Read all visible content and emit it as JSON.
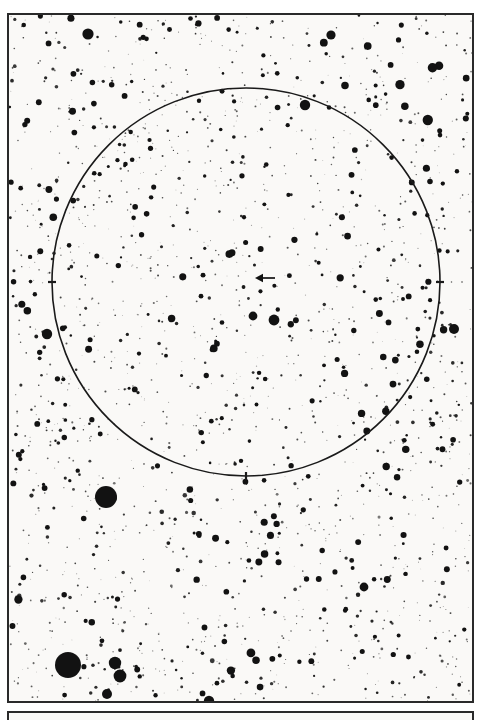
{
  "figure": {
    "kind": "astronomical-finder-chart",
    "title": "Star field finder chart",
    "background_color": "#faf9f7",
    "ink_color": "#121212",
    "frame_color": "#2a2a2a"
  },
  "plate": {
    "frame": {
      "x": 7,
      "y": 13,
      "width": 467,
      "height": 690,
      "border_width": 2
    },
    "secondary_frame": {
      "x": 7,
      "y": 711,
      "width": 467,
      "height": 9,
      "border_width": 2
    }
  },
  "chart_data": {
    "type": "scatter",
    "title": "Star field finder chart",
    "subtitle": "",
    "xlabel": "",
    "ylabel": "",
    "xlim": [
      0,
      467
    ],
    "ylim": [
      0,
      690
    ],
    "grid": false,
    "legend_position": "none",
    "annotations": [
      {
        "name": "target-arrow",
        "type": "arrow",
        "label": "",
        "tip_x": 246,
        "tip_y": 263,
        "tail_x": 266,
        "tail_y": 263,
        "direction": "left",
        "color": "#121212"
      }
    ],
    "overlays": [
      {
        "name": "field-of-view-circle",
        "type": "circle",
        "cx": 237,
        "cy": 267,
        "r": 194,
        "stroke": "#1a1a1a",
        "stroke_width": 1.6,
        "ticks": [
          {
            "angle_deg": 180,
            "label": ""
          },
          {
            "angle_deg": 0,
            "label": ""
          },
          {
            "angle_deg": 270,
            "label": ""
          }
        ]
      }
    ],
    "named_stars": [
      {
        "name": "bright-star-lower-left-a",
        "x": 97,
        "y": 482,
        "r": 11.0
      },
      {
        "name": "bright-star-bottom-left",
        "x": 59,
        "y": 650,
        "r": 13.0
      },
      {
        "name": "star-bottom-left-b",
        "x": 106,
        "y": 648,
        "r": 6.2
      },
      {
        "name": "star-bottom-left-c",
        "x": 111,
        "y": 661,
        "r": 6.4
      },
      {
        "name": "star-bottom-left-d",
        "x": 98,
        "y": 679,
        "r": 5.0
      },
      {
        "name": "star-left-edge",
        "x": 38,
        "y": 319,
        "r": 5.2
      },
      {
        "name": "star-right-edge",
        "x": 445,
        "y": 314,
        "r": 5.0
      },
      {
        "name": "star-inside-circle-a",
        "x": 265,
        "y": 305,
        "r": 5.4
      },
      {
        "name": "star-inside-circle-b",
        "x": 244,
        "y": 301,
        "r": 4.4
      },
      {
        "name": "star-top-left",
        "x": 79,
        "y": 19,
        "r": 5.6
      },
      {
        "name": "star-top-centre",
        "x": 322,
        "y": 20,
        "r": 4.6
      },
      {
        "name": "star-upper-right",
        "x": 296,
        "y": 90,
        "r": 5.2
      },
      {
        "name": "star-mid-lower-right",
        "x": 355,
        "y": 572,
        "r": 4.4
      },
      {
        "name": "star-bottom-centre",
        "x": 200,
        "y": 686,
        "r": 5.2
      }
    ],
    "field_statistics": {
      "approx_star_count": 1450,
      "size_classes": [
        "faint",
        "medium",
        "bright",
        "very-bright"
      ],
      "density": "very high"
    }
  },
  "accessibility": {
    "alt_text": "Black-and-white photographic star chart. A thin circle with small tick marks outlines the field of view in the upper two-thirds, and a short arrow inside the circle points left to a faint star near the centre. Several conspicuously bright stars appear in the lower-left of the frame."
  }
}
